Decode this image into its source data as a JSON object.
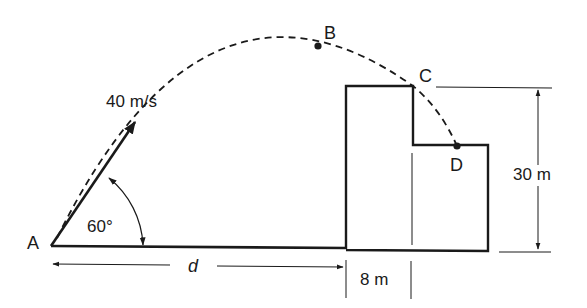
{
  "diagram": {
    "type": "projectile-motion",
    "points": {
      "A": "A",
      "B": "B",
      "C": "C",
      "D": "D"
    },
    "labels": {
      "velocity": "40 m/s",
      "angle": "60°",
      "distance": "d",
      "width": "8 m",
      "height": "30 m"
    },
    "colors": {
      "stroke": "#1a1a1a",
      "background": "#ffffff"
    }
  }
}
